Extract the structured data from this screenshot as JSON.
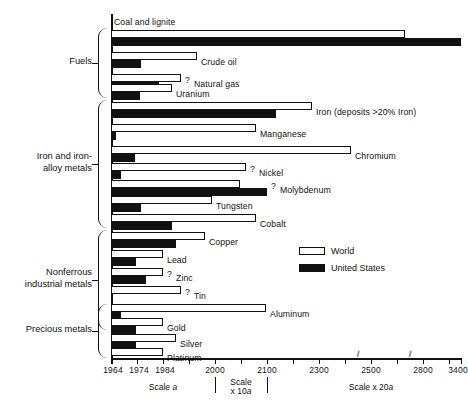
{
  "chart_data": {
    "type": "bar",
    "title": "",
    "xlabel": "",
    "ylabel": "",
    "orientation": "horizontal",
    "legend": {
      "position": "middle-right",
      "entries": [
        {
          "name": "World",
          "color": "#ffffff"
        },
        {
          "name": "United States",
          "color": "#111111"
        }
      ]
    },
    "axis": {
      "note": "Depletion year; piecewise (broken) scale",
      "ticks": [
        {
          "label": "1964",
          "value": 1964,
          "x": 111
        },
        {
          "label": "",
          "value": 1974,
          "x": 137
        },
        {
          "label": "1974",
          "value": 1974,
          "x": 137
        },
        {
          "label": "1984",
          "value": 1984,
          "x": 163
        },
        {
          "label": "2000",
          "value": 2000,
          "x": 215
        },
        {
          "label": "2100",
          "value": 2100,
          "x": 267
        },
        {
          "label": "2300",
          "value": 2300,
          "x": 319
        },
        {
          "label": "2500",
          "value": 2500,
          "x": 371
        },
        {
          "label": "2800",
          "value": 2800,
          "x": 423
        },
        {
          "label": "3400",
          "value": 3400,
          "x": 461
        }
      ],
      "tick_x_positions": [
        111,
        137,
        163,
        189,
        215,
        241,
        267,
        293,
        319,
        345,
        371,
        397,
        423,
        449,
        461
      ],
      "break_marks_x": [
        358,
        410
      ],
      "scale_segments": [
        {
          "label": "Scale a",
          "italic_part": "a",
          "center_x": 163
        },
        {
          "label": "Scale x 10a",
          "line1": "Scale",
          "line2": "x 10a",
          "center_x": 241
        },
        {
          "label": "Scale x 20a",
          "center_x": 371
        }
      ]
    },
    "groups": [
      {
        "name": "Fuels",
        "label_lines": [
          "Fuels"
        ],
        "top": 28,
        "height": 70
      },
      {
        "name": "Iron and iron-alloy metals",
        "label_lines": [
          "Iron and iron-",
          "alloy metals"
        ],
        "top": 100,
        "height": 128
      },
      {
        "name": "Nonferrous industrial metals",
        "label_lines": [
          "Nonferrous",
          "industrial metals"
        ],
        "top": 230,
        "height": 100
      },
      {
        "name": "Precious metals",
        "label_lines": [
          "Precious metals"
        ],
        "top": 304,
        "height": 54
      }
    ],
    "bars": [
      {
        "label": "Coal and lignite",
        "label_above": true,
        "uncertain": false,
        "world_end_x": 405,
        "us_end_x": 461,
        "top": 30
      },
      {
        "label": "Crude oil",
        "uncertain": false,
        "world_end_x": 197,
        "us_end_x": 141,
        "top": 52
      },
      {
        "label": "Natural gas",
        "uncertain": true,
        "world_end_x": 181,
        "us_end_x": 159,
        "top": 74
      },
      {
        "label": "Uranium",
        "uncertain": false,
        "world_end_x": 172,
        "us_end_x": 140,
        "top": 84
      },
      {
        "label": "Iron (deposits >20% Iron)",
        "uncertain": false,
        "world_end_x": 312,
        "us_end_x": 276,
        "top": 102
      },
      {
        "label": "Manganese",
        "uncertain": false,
        "world_end_x": 256,
        "us_end_x": 116,
        "top": 124
      },
      {
        "label": "Chromium",
        "uncertain": false,
        "world_end_x": 351,
        "us_end_x": 135,
        "top": 146
      },
      {
        "label": "Nickel",
        "uncertain": true,
        "world_end_x": 246,
        "us_end_x": 121,
        "top": 163
      },
      {
        "label": "Molybdenum",
        "uncertain": true,
        "world_end_x": 240,
        "us_end_x": 267,
        "top": 180
      },
      {
        "label": "Tungsten",
        "uncertain": false,
        "world_end_x": 212,
        "us_end_x": 141,
        "top": 196
      },
      {
        "label": "Cobalt",
        "uncertain": false,
        "world_end_x": 256,
        "us_end_x": 172,
        "top": 214
      },
      {
        "label": "Copper",
        "uncertain": false,
        "world_end_x": 205,
        "us_end_x": 176,
        "top": 232
      },
      {
        "label": "Lead",
        "uncertain": false,
        "world_end_x": 163,
        "us_end_x": 136,
        "top": 250
      },
      {
        "label": "Zinc",
        "uncertain": true,
        "world_end_x": 163,
        "us_end_x": 146,
        "top": 268
      },
      {
        "label": "Tin",
        "uncertain": true,
        "world_end_x": 181,
        "us_end_x": 112,
        "top": 286
      },
      {
        "label": "Aluminum",
        "uncertain": false,
        "world_end_x": 266,
        "us_end_x": 121,
        "top": 304
      },
      {
        "label": "Gold",
        "uncertain": false,
        "world_end_x": 163,
        "us_end_x": 136,
        "top": 318
      },
      {
        "label": "Silver",
        "uncertain": false,
        "world_end_x": 176,
        "us_end_x": 136,
        "top": 334
      },
      {
        "label": "Platinum",
        "uncertain": false,
        "world_end_x": 163,
        "us_end_x": 112,
        "top": 348
      }
    ]
  }
}
